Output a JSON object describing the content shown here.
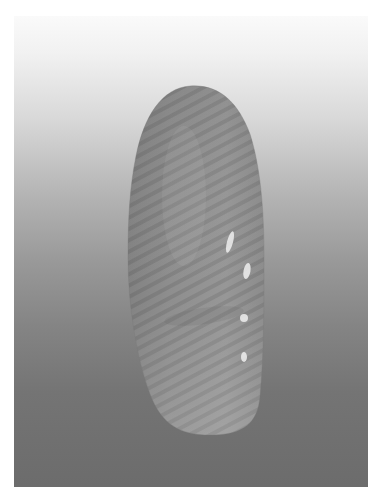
{
  "image": {
    "description": "Grayscale photograph of an elongated oval seed with fine diagonal striations on a vertical white-to-gray gradient background",
    "subject": "elongated seed",
    "colors": {
      "page_background": "#ffffff",
      "background_top": "#fafafa",
      "background_bottom": "#6c6c6c",
      "seed_base": "#8c8c8c",
      "seed_highlight": "#e8e8e8"
    },
    "highlights_count": 4
  }
}
